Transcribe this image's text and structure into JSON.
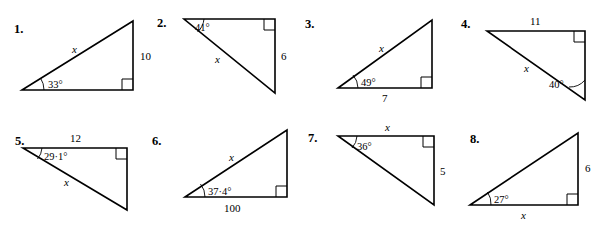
{
  "page": {
    "background_color": "#ffffff",
    "ink_color": "#000000",
    "problem_count": 8
  },
  "problems": [
    {
      "number": "1.",
      "orientation": "right-angle-bottom-right",
      "labels": {
        "angle": "33°",
        "hypotenuse": "x",
        "vertical": "10",
        "base": ""
      },
      "angle_vertex": "bottom-left"
    },
    {
      "number": "2.",
      "orientation": "right-angle-top-right",
      "labels": {
        "angle": "41°",
        "hypotenuse": "x",
        "vertical": "6",
        "top": ""
      },
      "angle_vertex": "top-left"
    },
    {
      "number": "3.",
      "orientation": "right-angle-bottom-right",
      "labels": {
        "angle": "49°",
        "hypotenuse": "x",
        "base": "7",
        "vertical": ""
      },
      "angle_vertex": "bottom-left"
    },
    {
      "number": "4.",
      "orientation": "right-angle-top-right",
      "labels": {
        "angle": "40°",
        "hypotenuse": "x",
        "top": "11",
        "vertical": ""
      },
      "angle_vertex": "bottom-right"
    },
    {
      "number": "5.",
      "orientation": "right-angle-top-right",
      "labels": {
        "angle": "29·1°",
        "hypotenuse": "x",
        "top": "12",
        "vertical": ""
      },
      "angle_vertex": "top-left"
    },
    {
      "number": "6.",
      "orientation": "right-angle-bottom-right",
      "labels": {
        "angle": "37·4°",
        "hypotenuse": "x",
        "base": "100",
        "vertical": ""
      },
      "angle_vertex": "bottom-left"
    },
    {
      "number": "7.",
      "orientation": "right-angle-top-right",
      "labels": {
        "angle": "36°",
        "top": "x",
        "vertical": "5",
        "hypotenuse": ""
      },
      "angle_vertex": "top-left"
    },
    {
      "number": "8.",
      "orientation": "right-angle-bottom-right",
      "labels": {
        "angle": "27°",
        "base": "x",
        "vertical": "6",
        "hypotenuse": ""
      },
      "angle_vertex": "bottom-left"
    }
  ]
}
